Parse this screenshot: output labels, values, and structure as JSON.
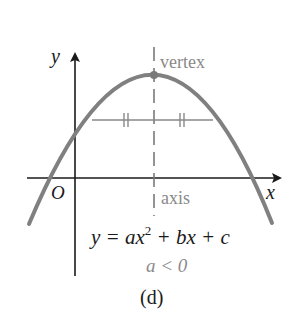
{
  "figure": {
    "caption": "(d)",
    "colors": {
      "axes": "#1a1a1a",
      "curve": "#808080",
      "annotation": "#8a8a8a",
      "text": "#1a1a1a",
      "background": "#ffffff"
    },
    "labels": {
      "y_axis": "y",
      "x_axis": "x",
      "origin": "O",
      "vertex": "vertex",
      "axis": "axis",
      "equation_prefix": "y = ax",
      "equation_exp": "2",
      "equation_suffix": " + bx + c",
      "condition": "a < 0"
    },
    "elements": {
      "curve": "downward-opening parabola",
      "vertex_marker": "filled dot at maximum point",
      "axis_of_symmetry": "vertical dashed line through vertex",
      "chord": "horizontal segment with equal-length tick marks on each side of axis"
    }
  }
}
